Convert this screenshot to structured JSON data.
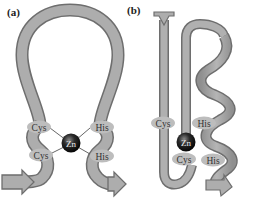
{
  "panels": [
    {
      "label": "(a)",
      "description": "Zinc finger loop: beta-hairpin-like ribbon with Zn coordinated by two Cys and two His",
      "residues": {
        "cys_top": "Cys",
        "cys_bottom": "Cys",
        "his_top": "His",
        "his_bottom": "His"
      },
      "metal": "Zn"
    },
    {
      "label": "(b)",
      "description": "Zinc finger: beta strands and alpha helix with Zn coordinated by two Cys and two His",
      "residues": {
        "cys_top": "Cys",
        "cys_bottom": "Cys",
        "his_top": "His",
        "his_bottom": "His"
      },
      "metal": "Zn"
    }
  ],
  "colors": {
    "ribbon_fill": "#a9a9a9",
    "ribbon_edge": "#6e6e6e",
    "label_blob": "#b8b8b8",
    "zn_sphere": "#1a1a1a",
    "bond_line": "#555555"
  }
}
